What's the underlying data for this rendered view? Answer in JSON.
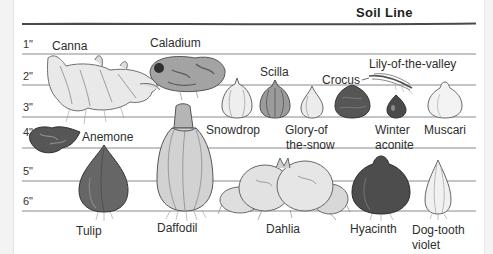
{
  "title": "Soil Line",
  "depths": [
    "1\"",
    "2\"",
    "3\"",
    "4\"",
    "5\"",
    "6\""
  ],
  "plants": [
    {
      "name": "canna",
      "lines": [
        "Canna"
      ]
    },
    {
      "name": "caladium",
      "lines": [
        "Caladium"
      ]
    },
    {
      "name": "scilla",
      "lines": [
        "Scilla"
      ]
    },
    {
      "name": "crocus",
      "lines": [
        "Crocus"
      ]
    },
    {
      "name": "lily-of-the-valley",
      "lines": [
        "Lily-of-the-valley"
      ]
    },
    {
      "name": "snowdrop",
      "lines": [
        "Snowdrop"
      ]
    },
    {
      "name": "glory-of-the-snow",
      "lines": [
        "Glory-of",
        "the-snow"
      ]
    },
    {
      "name": "winter-aconite",
      "lines": [
        "Winter",
        "aconite"
      ]
    },
    {
      "name": "muscari",
      "lines": [
        "Muscari"
      ]
    },
    {
      "name": "anemone",
      "lines": [
        "Anemone"
      ]
    },
    {
      "name": "tulip",
      "lines": [
        "Tulip"
      ]
    },
    {
      "name": "daffodil",
      "lines": [
        "Daffodil"
      ]
    },
    {
      "name": "dahlia",
      "lines": [
        "Dahlia"
      ]
    },
    {
      "name": "hyacinth",
      "lines": [
        "Hyacinth"
      ]
    },
    {
      "name": "dog-tooth-violet",
      "lines": [
        "Dog-tooth",
        "violet"
      ]
    }
  ],
  "colors": {
    "soil_line": "#4a4a4a",
    "depth_line": "#8a8a8a",
    "dark_bulb": "#4d4d4d",
    "light_bulb": "#ececec"
  }
}
